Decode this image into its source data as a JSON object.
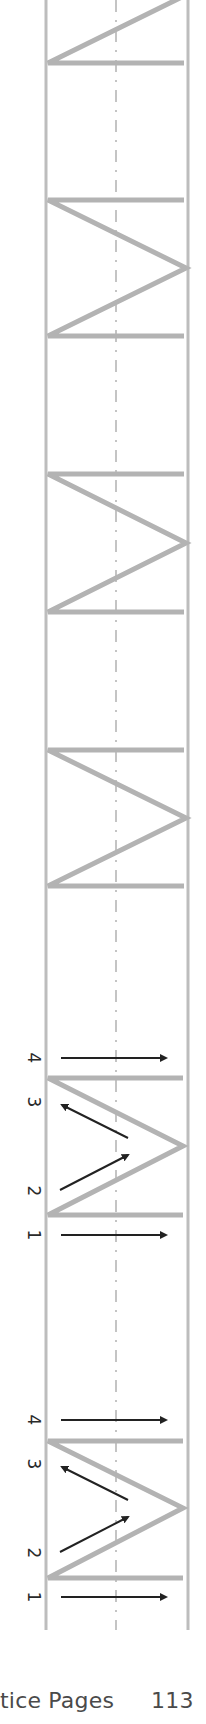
{
  "page": {
    "footer_title": "tice Pages",
    "page_number": "113"
  },
  "colors": {
    "guide_line": "#bdbdbd",
    "tracing_stroke": "#b3b3b3",
    "arrow": "#222222",
    "footer_text": "#4a4a4a",
    "background": "#ffffff"
  },
  "guides": {
    "left_x": 46,
    "mid_x": 116,
    "right_x": 188,
    "top_y": 0,
    "bottom_y": 1630
  },
  "letter": "M",
  "traced_letters": [
    {
      "label": "M (partial, top)",
      "bar_bottom_y": 63
    },
    {
      "label": "M",
      "bar_top_y": 200,
      "apex_y": 268,
      "bar_bottom_y": 336
    },
    {
      "label": "M",
      "bar_top_y": 474,
      "apex_y": 543,
      "bar_bottom_y": 612
    },
    {
      "label": "M",
      "bar_top_y": 750,
      "apex_y": 818,
      "bar_bottom_y": 886
    }
  ],
  "guided_letters": [
    {
      "bar_top_y": 1078,
      "apex_y": 1146,
      "bar_bottom_y": 1215,
      "stroke_labels": [
        "1",
        "2",
        "3",
        "4"
      ]
    },
    {
      "bar_top_y": 1441,
      "apex_y": 1508,
      "bar_bottom_y": 1578,
      "stroke_labels": [
        "1",
        "2",
        "3",
        "4"
      ]
    }
  ]
}
